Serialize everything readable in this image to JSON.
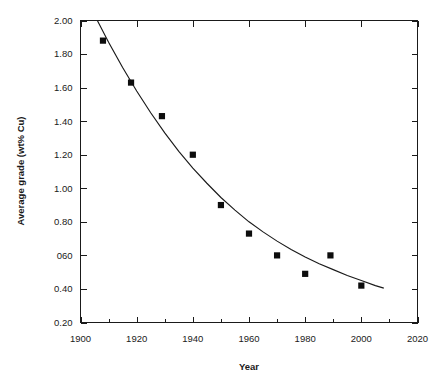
{
  "chart_data": {
    "type": "scatter",
    "title": "",
    "subtitle": "",
    "xlabel": "Year",
    "ylabel": "Average grade (wt% Cu)",
    "xlim": [
      1900,
      2020
    ],
    "ylim": [
      0.2,
      2.0
    ],
    "grid": false,
    "legend": "none",
    "x_ticks": [
      1900,
      1920,
      1940,
      1960,
      1980,
      2000,
      2020
    ],
    "x_tick_labels": [
      "1900",
      "1920",
      "1940",
      "1960",
      "1980",
      "2000",
      "2020"
    ],
    "x_minor_ticks": [
      1910,
      1930,
      1950,
      1970,
      1990,
      2010
    ],
    "y_ticks": [
      0.2,
      0.4,
      0.6,
      0.8,
      1.0,
      1.2,
      1.4,
      1.6,
      1.8,
      2.0
    ],
    "y_tick_labels": [
      "0.20",
      "0.40",
      "060",
      "0.80",
      "1.00",
      "1.20",
      "1.40",
      "1.60",
      "1.80",
      "2.00"
    ],
    "frame": "box-all-sides-inward-ticks",
    "series": [
      {
        "name": "Average ore grade",
        "type": "scatter",
        "marker": "filled-square",
        "color": "#0d0d0d",
        "x": [
          1908,
          1918,
          1929,
          1940,
          1950,
          1960,
          1970,
          1980,
          1989,
          2000
        ],
        "y": [
          1.88,
          1.63,
          1.43,
          1.2,
          0.9,
          0.73,
          0.6,
          0.49,
          0.6,
          0.42
        ],
        "points": [
          {
            "year": 1908,
            "grade": 1.88
          },
          {
            "year": 1918,
            "grade": 1.63
          },
          {
            "year": 1929,
            "grade": 1.43
          },
          {
            "year": 1940,
            "grade": 1.2
          },
          {
            "year": 1950,
            "grade": 0.9
          },
          {
            "year": 1960,
            "grade": 0.73
          },
          {
            "year": 1970,
            "grade": 0.6
          },
          {
            "year": 1980,
            "grade": 0.49
          },
          {
            "year": 1989,
            "grade": 0.6
          },
          {
            "year": 2000,
            "grade": 0.42
          }
        ]
      },
      {
        "name": "Fitted trend curve",
        "type": "line",
        "color": "#1a1a1a",
        "x_range": [
          1906,
          2008
        ],
        "x": [
          1906,
          1910,
          1915,
          1920,
          1925,
          1930,
          1935,
          1940,
          1945,
          1950,
          1955,
          1960,
          1965,
          1970,
          1975,
          1980,
          1985,
          1990,
          1995,
          2000,
          2005,
          2008
        ],
        "y": [
          2.0,
          1.87,
          1.72,
          1.58,
          1.45,
          1.33,
          1.22,
          1.12,
          1.03,
          0.945,
          0.87,
          0.8,
          0.74,
          0.685,
          0.635,
          0.59,
          0.55,
          0.515,
          0.48,
          0.45,
          0.42,
          0.405
        ]
      }
    ]
  },
  "axes": {
    "x_title": "Year",
    "y_title": "Average grade (wt% Cu)"
  }
}
